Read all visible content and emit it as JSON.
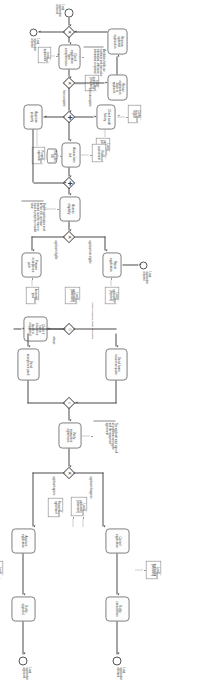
{
  "diagram": {
    "notation": "BPMN",
    "orientation": "rotated-90",
    "canvas": {
      "width": 692,
      "height": 223
    },
    "colors": {
      "stroke": "#8f8f8f",
      "flow": "#4a4a4a",
      "dataflow": "#9a9a9a",
      "text": "#3b3b3b",
      "background": "#ffffff"
    }
  },
  "events": [
    {
      "id": "ev-start",
      "type": "start",
      "label": "Loan\napplication\nreceived"
    },
    {
      "id": "ev-end-decline",
      "type": "end",
      "label": "Loan\napplication\ndeclined"
    },
    {
      "id": "ev-end-approve",
      "type": "end",
      "label": "Loan\napplication\napproved"
    },
    {
      "id": "ev-end-reject",
      "type": "end",
      "label": "Loan\napplication\nrejected"
    }
  ],
  "tasks": [
    {
      "id": "t-check-form",
      "label": "Check\napplication\nform\ncompleteness"
    },
    {
      "id": "t-return-app",
      "label": "Return\napplication\nback to\napplicant"
    },
    {
      "id": "t-receive-upd",
      "label": "Receive\nupdated\napplication"
    },
    {
      "id": "t-check-credit",
      "label": "Check credit\nhistory"
    },
    {
      "id": "t-assess-risk",
      "label": "Assess loan\nrisk"
    },
    {
      "id": "t-appraise",
      "label": "Appraise\nproperty"
    },
    {
      "id": "t-assess-elig",
      "label": "Assess\neligibility"
    },
    {
      "id": "t-reject-app",
      "label": "Reject\napplication"
    },
    {
      "id": "t-prepare-pack",
      "label": "Prepare\nacceptance\npack"
    },
    {
      "id": "t-check-quote",
      "label": "Check if\nhome\ninsurance\nquote is\nrequested"
    },
    {
      "id": "t-send-quote",
      "label": "Send home\ninsurance quote"
    },
    {
      "id": "t-send-pack",
      "label": "Send\nacceptance pack"
    },
    {
      "id": "t-verify-repay",
      "label": "Verify\nrepayment\nagreement"
    },
    {
      "id": "t-cancel-app",
      "label": "Cancel\napplication"
    },
    {
      "id": "t-approve-app",
      "label": "Approve\napplication"
    },
    {
      "id": "t-notify-cancel",
      "label": "Notify\ncancellation"
    },
    {
      "id": "t-notify-appr",
      "label": "Notify\napproval"
    }
  ],
  "gateways": [
    {
      "id": "gw-form-xor",
      "type": "xor",
      "marker": "✕"
    },
    {
      "id": "gw-par-split",
      "type": "parallel",
      "marker": "✚"
    },
    {
      "id": "gw-par-join",
      "type": "parallel",
      "marker": "✚"
    },
    {
      "id": "gw-elig-xor",
      "type": "xor",
      "marker": "✕"
    },
    {
      "id": "gw-reject-xor",
      "type": "xor",
      "marker": "✕"
    },
    {
      "id": "gw-quote-xor",
      "type": "xor",
      "marker": "◇"
    },
    {
      "id": "gw-quote-join",
      "type": "or",
      "marker": "○"
    },
    {
      "id": "gw-verify-xor",
      "type": "xor",
      "marker": "✕"
    }
  ],
  "data_objects": [
    {
      "id": "do-loan-app",
      "label": "Loan\napplication"
    },
    {
      "id": "do-loan-checked",
      "label": "Loan\napplication\n[checked]"
    },
    {
      "id": "do-credit-report",
      "label": "Credit\nhistory report"
    },
    {
      "id": "do-loan-completed",
      "label": "Loan\napplication\n[completed]"
    },
    {
      "id": "do-risk-assess",
      "label": "Risk\nassessment"
    },
    {
      "id": "do-prop-appraisal",
      "label": "Property\nappraisal"
    },
    {
      "id": "do-loan-rejected",
      "label": "Loan\napplication\n[rejected]"
    },
    {
      "id": "do-loan-assessed",
      "label": "Loan\napplication\n[assessed]"
    },
    {
      "id": "do-accept-pack",
      "label": "Acceptance\npack"
    },
    {
      "id": "do-repay-agree",
      "label": "Repayment\nagreement"
    },
    {
      "id": "do-loan-cancelled",
      "label": "Loan\napplication\n[cancelled]"
    },
    {
      "id": "do-loan-approved",
      "label": "Loan\napplication\n[approved]"
    }
  ],
  "data_stores": [
    {
      "id": "ds-risk-rules",
      "label": "Risk rules\nDB"
    }
  ],
  "annotations": [
    {
      "id": "an-mandatory",
      "text": "Mandatory fields are customer and loan value information, otherwise information is optional"
    },
    {
      "id": "an-eligible",
      "text": "Eligible applications must be low risk, and loan amount must be lower or equal to property's market value"
    },
    {
      "id": "an-verify",
      "text": "The applicant must sign off all conditions and agree with the repayment agreement"
    }
  ],
  "flow_labels": [
    {
      "id": "fl-incomplete",
      "text": "form incomplete"
    },
    {
      "id": "fl-complete",
      "text": "form complete"
    },
    {
      "id": "fl-not-elig",
      "text": "applicant not eligible"
    },
    {
      "id": "fl-elig",
      "text": "applicant eligible"
    },
    {
      "id": "fl-quote-req",
      "text": "home insurance quote requested"
    },
    {
      "id": "fl-always",
      "text": "always"
    },
    {
      "id": "fl-disagrees",
      "text": "applicant disagrees"
    },
    {
      "id": "fl-agrees",
      "text": "applicant agrees"
    }
  ]
}
